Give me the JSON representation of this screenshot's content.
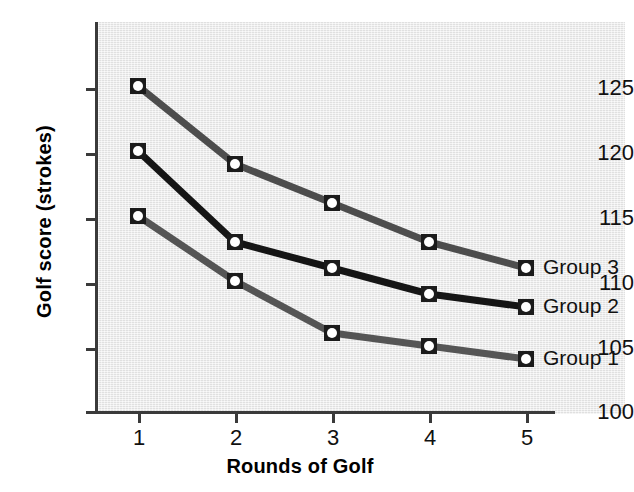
{
  "chart_data": {
    "type": "line",
    "title": "",
    "xlabel": "Rounds of Golf",
    "ylabel": "Golf score (strokes)",
    "x": [
      1,
      2,
      3,
      4,
      5
    ],
    "categories": [
      "1",
      "2",
      "3",
      "4",
      "5"
    ],
    "xticklabels": [
      "1",
      "2",
      "3",
      "4",
      "5"
    ],
    "yticklabels": [
      "100",
      "105",
      "110",
      "115",
      "120",
      "125"
    ],
    "yticks": [
      100,
      105,
      110,
      115,
      120,
      125
    ],
    "xlim": [
      0.6,
      5.55
    ],
    "ylim": [
      100,
      127.5
    ],
    "grid": false,
    "legend_position": "right-inline-end-of-line",
    "series": [
      {
        "name": "Group 3",
        "values": [
          125,
          119,
          116,
          113,
          111
        ],
        "color": "#4d4d4d"
      },
      {
        "name": "Group 2",
        "values": [
          120,
          113,
          111,
          109,
          108
        ],
        "color": "#151515"
      },
      {
        "name": "Group 1",
        "values": [
          115,
          110,
          106,
          105,
          104
        ],
        "color": "#555555"
      }
    ]
  },
  "axes": {
    "y_title": "Golf score (strokes)",
    "x_title": "Rounds of Golf",
    "y_labels": {
      "t125": "125",
      "t120": "120",
      "t115": "115",
      "t110": "110",
      "t105": "105",
      "t100": "100"
    },
    "x_labels": {
      "t1": "1",
      "t2": "2",
      "t3": "3",
      "t4": "4",
      "t5": "5"
    }
  },
  "legend": {
    "group3": "Group 3",
    "group2": "Group 2",
    "group1": "Group 1"
  },
  "colors": {
    "plot_background": "#e9e9e9",
    "axis": "#3a3a3a",
    "series3": "#4d4d4d",
    "series2": "#151515",
    "series1": "#555555",
    "marker_fill": "#ffffff",
    "marker_edge": "#1b1b1b",
    "text": "#111111"
  }
}
